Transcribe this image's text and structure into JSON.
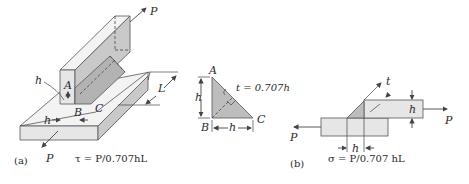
{
  "figure": {
    "panel_a": {
      "label": "(a)",
      "force_top": "P",
      "force_bottom": "P",
      "dim_h_left": "h",
      "dim_h_bottom": "h",
      "dim_L": "L",
      "point_A": "A",
      "point_B": "B",
      "point_C": "C",
      "equation": "τ = P/0.707hL"
    },
    "triangle_detail": {
      "point_A": "A",
      "point_B": "B",
      "point_C": "C",
      "dim_h_vertical": "h",
      "dim_h_horizontal": "h",
      "throat": "t = 0.707h"
    },
    "panel_b": {
      "label": "(b)",
      "force_left": "P",
      "force_right": "P",
      "dim_t": "t",
      "dim_h_right": "h",
      "dim_h_bottom": "h",
      "equation": "σ = P/0.707 hL"
    },
    "colors": {
      "plate_light": "#e6e6e6",
      "plate_top": "#f3f3f3",
      "weld_gray": "#bdbdbd",
      "line": "#555555"
    }
  }
}
